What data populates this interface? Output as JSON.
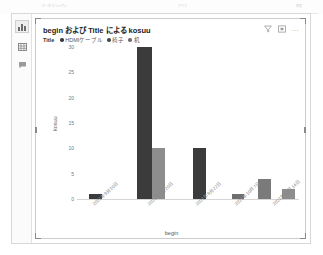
{
  "chrome": {
    "tab_label": "データビジュアル",
    "center_label": "グラフ",
    "right_label": "設定"
  },
  "sidebar": {
    "items": [
      {
        "name": "chart-view",
        "icon": "bar-chart-icon",
        "selected": true
      },
      {
        "name": "table-view",
        "icon": "table-grid-icon",
        "selected": false
      },
      {
        "name": "comment-view",
        "icon": "speech-bubble-icon",
        "selected": false
      }
    ]
  },
  "card": {
    "title": "begin および Title による kosuu",
    "actions": [
      {
        "name": "filter-icon",
        "label": "filter-icon"
      },
      {
        "name": "focus-mode-icon",
        "label": "expand-icon"
      },
      {
        "name": "more-options-icon",
        "label": "…"
      }
    ]
  },
  "legend": {
    "title": "Title",
    "items": [
      {
        "label": "HDMIケーブル",
        "color": "#3b3b3b"
      },
      {
        "label": "椅子",
        "color": "#4a4a4a"
      },
      {
        "label": "机",
        "color": "#8d8d8d"
      }
    ]
  },
  "chart_data": {
    "type": "bar",
    "title": "begin および Title による kosuu",
    "xlabel": "begin",
    "ylabel": "kosuu",
    "ylim": [
      0,
      30
    ],
    "yticks": [
      30,
      25,
      20,
      15,
      10,
      5,
      0
    ],
    "grid": false,
    "legend_position": "top-left",
    "categories": [
      "2021年9月10日",
      "2021年9月20日",
      "2021年9月22日",
      "2021年10月7日",
      "2021年10月14日"
    ],
    "series": [
      {
        "name": "HDMIケーブル",
        "color": "#3b3b3b",
        "values": [
          1,
          30,
          10,
          1,
          0
        ]
      },
      {
        "name": "椅子",
        "color": "#4a4a4a",
        "values": [
          0,
          0,
          0,
          0,
          4
        ]
      },
      {
        "name": "机",
        "color": "#8d8d8d",
        "values": [
          0,
          10,
          0,
          0,
          2
        ]
      }
    ],
    "bars": [
      {
        "category": "2021年9月10日",
        "series": "HDMIケーブル",
        "value": 1,
        "color": "#3b3b3b",
        "x": 12,
        "width": 13
      },
      {
        "category": "2021年9月20日",
        "series": "HDMIケーブル",
        "value": 30,
        "color": "#3b3b3b",
        "x": 60,
        "width": 15
      },
      {
        "category": "2021年9月20日",
        "series": "机",
        "value": 10,
        "color": "#8d8d8d",
        "x": 75,
        "width": 13
      },
      {
        "category": "2021年9月22日",
        "series": "HDMIケーブル",
        "value": 10,
        "color": "#3b3b3b",
        "x": 116,
        "width": 13
      },
      {
        "category": "2021年10月7日",
        "series": "HDMIケーブル",
        "value": 1,
        "color": "#6e6e6e",
        "x": 155,
        "width": 12
      },
      {
        "category": "2021年10月14日",
        "series": "椅子",
        "value": 4,
        "color": "#7a7a7a",
        "x": 181,
        "width": 13
      },
      {
        "category": "2021年10月14日",
        "series": "机",
        "value": 2,
        "color": "#8d8d8d",
        "x": 205,
        "width": 13
      }
    ]
  }
}
